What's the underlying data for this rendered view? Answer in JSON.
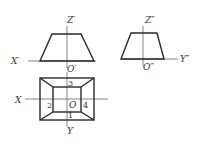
{
  "diagram": {
    "type": "orthographic-projection",
    "front_view": {
      "shape": "trapezoid",
      "axis_labels": {
        "vertical": "Z′",
        "horizontal": "X′",
        "origin": "O′"
      }
    },
    "side_view": {
      "shape": "trapezoid",
      "axis_labels": {
        "vertical": "Z″",
        "horizontal": "Y″",
        "origin": "O″"
      }
    },
    "top_view": {
      "shape": "frustum-top-view",
      "axis_labels": {
        "horizontal": "X",
        "vertical": "Y",
        "origin": "O"
      },
      "face_numbers": [
        "1",
        "2",
        "3",
        "4"
      ]
    },
    "colors": {
      "line": "#2a2a2a",
      "axis": "#555555",
      "text": "#333333"
    }
  }
}
